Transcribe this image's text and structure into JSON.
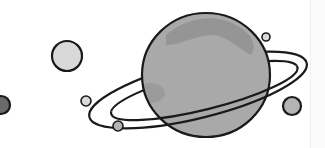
{
  "illustration": {
    "title": "Ringed planet with moons",
    "colors": {
      "outline": "#1a1a1a",
      "planet_fill": "#a9a9a9",
      "planet_patch": "#959595",
      "moon_light": "#d9d9d9",
      "moon_mid": "#b4b4b4",
      "moon_dark": "#6a6a6a",
      "background": "#ffffff"
    },
    "planet": {
      "cx": 206,
      "cy": 75,
      "rx": 64,
      "ry": 62
    },
    "ring": {
      "cx": 198,
      "cy": 90,
      "rx": 112,
      "ry": 28,
      "rotate": -14
    },
    "moons": [
      {
        "name": "dark-moon-left-edge",
        "cx": 1,
        "cy": 105,
        "r": 9,
        "fill": "moon_dark"
      },
      {
        "name": "large-light-moon",
        "cx": 67,
        "cy": 56,
        "r": 15,
        "fill": "moon_light"
      },
      {
        "name": "small-moon-ring-left",
        "cx": 86,
        "cy": 101,
        "r": 5,
        "fill": "moon_light"
      },
      {
        "name": "small-moon-below-ring",
        "cx": 118,
        "cy": 126,
        "r": 5,
        "fill": "moon_mid"
      },
      {
        "name": "tiny-moon-top-right",
        "cx": 266,
        "cy": 37,
        "r": 4,
        "fill": "moon_light"
      },
      {
        "name": "gray-moon-right",
        "cx": 292,
        "cy": 106,
        "r": 9,
        "fill": "moon_mid"
      }
    ]
  }
}
